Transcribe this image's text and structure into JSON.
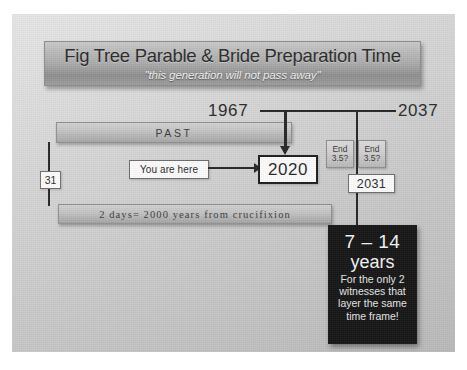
{
  "slide": {
    "title": {
      "main": "Fig Tree Parable & Bride Preparation Time",
      "subtitle": "\"this generation will not pass away\""
    },
    "timeline": {
      "start_year": "1967",
      "end_year": "2037",
      "mid_year": "2031",
      "past_label": "PAST",
      "present_year": "2020",
      "you_are_here": "You are here",
      "left_marker": "31"
    },
    "end_boxes": [
      {
        "line1": "End",
        "line2": "3.5?"
      },
      {
        "line1": "End",
        "line2": "3.5?"
      }
    ],
    "days_bar": "2 days= 2000 years from crucifixion",
    "callout": {
      "range": "7 – 14",
      "unit": "years",
      "note": "For the only 2 witnesses that layer the same time frame!"
    },
    "colors": {
      "canvas_light": "#e6e6e6",
      "canvas_dark": "#b9b9b9",
      "ink": "#252525",
      "callout_bg": "#151515",
      "plate_dark": "#8e8e8e"
    }
  }
}
